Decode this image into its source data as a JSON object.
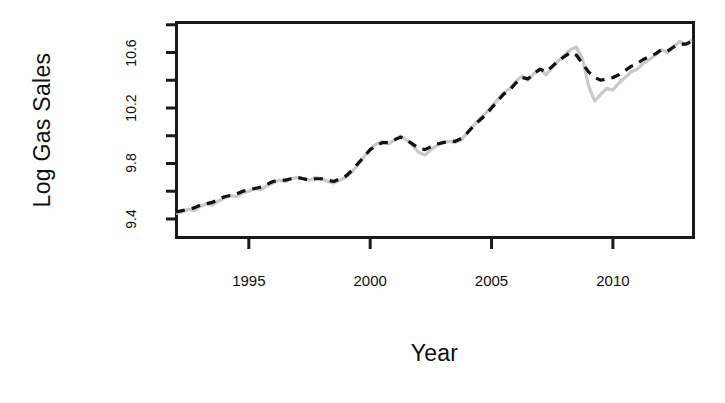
{
  "chart_data": {
    "type": "line",
    "title": "",
    "xlabel": "Year",
    "ylabel": "Log Gas Sales",
    "xlim": [
      1992.0,
      2013.3
    ],
    "ylim": [
      9.27,
      10.82
    ],
    "grid": false,
    "legend": "none",
    "x_ticks": [
      1995,
      2000,
      2005,
      2010
    ],
    "x_tick_labels": [
      "1995",
      "2000",
      "2005",
      "2010"
    ],
    "y_ticks": [
      9.4,
      9.6,
      9.8,
      10.0,
      10.2,
      10.4,
      10.6,
      10.8
    ],
    "y_tick_labels": [
      "9.4",
      "",
      "9.8",
      "",
      "10.2",
      "",
      "10.6",
      ""
    ],
    "y_major_ticks": [
      9.4,
      9.8,
      10.2,
      10.6
    ],
    "series": [
      {
        "name": "Observed Log Gas Sales",
        "style": "solid",
        "color": "#c9c9c9",
        "width": 3.2,
        "x": [
          1992.0,
          1992.25,
          1992.5,
          1992.75,
          1993.0,
          1993.25,
          1993.5,
          1993.75,
          1994.0,
          1994.25,
          1994.5,
          1994.75,
          1995.0,
          1995.25,
          1995.5,
          1995.75,
          1996.0,
          1996.25,
          1996.5,
          1996.75,
          1997.0,
          1997.25,
          1997.5,
          1997.75,
          1998.0,
          1998.25,
          1998.5,
          1998.75,
          1999.0,
          1999.25,
          1999.5,
          1999.75,
          2000.0,
          2000.25,
          2000.5,
          2000.75,
          2001.0,
          2001.25,
          2001.5,
          2001.75,
          2002.0,
          2002.25,
          2002.5,
          2002.75,
          2003.0,
          2003.25,
          2003.5,
          2003.75,
          2004.0,
          2004.25,
          2004.5,
          2004.75,
          2005.0,
          2005.25,
          2005.5,
          2005.75,
          2006.0,
          2006.25,
          2006.5,
          2006.75,
          2007.0,
          2007.25,
          2007.5,
          2007.75,
          2008.0,
          2008.25,
          2008.5,
          2008.75,
          2009.0,
          2009.25,
          2009.5,
          2009.75,
          2010.0,
          2010.25,
          2010.5,
          2010.75,
          2011.0,
          2011.25,
          2011.5,
          2011.75,
          2012.0,
          2012.25,
          2012.5,
          2012.75,
          2013.0,
          2013.25
        ],
        "y": [
          9.44,
          9.45,
          9.47,
          9.46,
          9.49,
          9.51,
          9.5,
          9.53,
          9.55,
          9.57,
          9.56,
          9.59,
          9.6,
          9.62,
          9.61,
          9.64,
          9.66,
          9.68,
          9.67,
          9.69,
          9.7,
          9.69,
          9.68,
          9.7,
          9.69,
          9.67,
          9.66,
          9.68,
          9.7,
          9.74,
          9.79,
          9.85,
          9.9,
          9.94,
          9.96,
          9.94,
          9.97,
          10.0,
          9.97,
          9.93,
          9.88,
          9.86,
          9.9,
          9.93,
          9.95,
          9.96,
          9.95,
          9.97,
          10.02,
          10.07,
          10.12,
          10.16,
          10.21,
          10.26,
          10.31,
          10.34,
          10.39,
          10.43,
          10.4,
          10.45,
          10.48,
          10.44,
          10.49,
          10.54,
          10.58,
          10.62,
          10.64,
          10.55,
          10.36,
          10.25,
          10.3,
          10.34,
          10.33,
          10.38,
          10.42,
          10.46,
          10.48,
          10.52,
          10.55,
          10.58,
          10.62,
          10.6,
          10.64,
          10.68,
          10.66,
          10.69
        ]
      },
      {
        "name": "Fitted / Forecast Log Gas Sales",
        "style": "dashed",
        "color": "#111111",
        "width": 3.2,
        "x": [
          1992.0,
          1992.25,
          1992.5,
          1992.75,
          1993.0,
          1993.25,
          1993.5,
          1993.75,
          1994.0,
          1994.25,
          1994.5,
          1994.75,
          1995.0,
          1995.25,
          1995.5,
          1995.75,
          1996.0,
          1996.25,
          1996.5,
          1996.75,
          1997.0,
          1997.25,
          1997.5,
          1997.75,
          1998.0,
          1998.25,
          1998.5,
          1998.75,
          1999.0,
          1999.25,
          1999.5,
          1999.75,
          2000.0,
          2000.25,
          2000.5,
          2000.75,
          2001.0,
          2001.25,
          2001.5,
          2001.75,
          2002.0,
          2002.25,
          2002.5,
          2002.75,
          2003.0,
          2003.25,
          2003.5,
          2003.75,
          2004.0,
          2004.25,
          2004.5,
          2004.75,
          2005.0,
          2005.25,
          2005.5,
          2005.75,
          2006.0,
          2006.25,
          2006.5,
          2006.75,
          2007.0,
          2007.25,
          2007.5,
          2007.75,
          2008.0,
          2008.25,
          2008.5,
          2008.75,
          2009.0,
          2009.25,
          2009.5,
          2009.75,
          2010.0,
          2010.25,
          2010.5,
          2010.75,
          2011.0,
          2011.25,
          2011.5,
          2011.75,
          2012.0,
          2012.25,
          2012.5,
          2012.75,
          2013.0,
          2013.25
        ],
        "y": [
          9.45,
          9.46,
          9.47,
          9.48,
          9.5,
          9.51,
          9.52,
          9.54,
          9.56,
          9.57,
          9.58,
          9.6,
          9.61,
          9.62,
          9.63,
          9.65,
          9.67,
          9.68,
          9.68,
          9.69,
          9.7,
          9.69,
          9.68,
          9.69,
          9.69,
          9.68,
          9.67,
          9.69,
          9.71,
          9.75,
          9.8,
          9.85,
          9.9,
          9.93,
          9.95,
          9.95,
          9.97,
          9.99,
          9.97,
          9.94,
          9.91,
          9.9,
          9.92,
          9.94,
          9.95,
          9.96,
          9.96,
          9.98,
          10.02,
          10.07,
          10.11,
          10.15,
          10.2,
          10.25,
          10.3,
          10.33,
          10.38,
          10.42,
          10.41,
          10.45,
          10.48,
          10.46,
          10.5,
          10.54,
          10.57,
          10.6,
          10.58,
          10.52,
          10.46,
          10.42,
          10.4,
          10.41,
          10.42,
          10.44,
          10.47,
          10.5,
          10.52,
          10.55,
          10.57,
          10.59,
          10.62,
          10.61,
          10.64,
          10.66,
          10.66,
          10.68
        ]
      }
    ]
  },
  "axes": {
    "box_color": "#1a1a1a",
    "background": "#ffffff"
  }
}
